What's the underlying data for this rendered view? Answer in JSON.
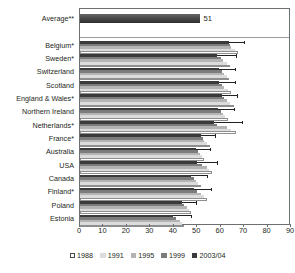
{
  "chart_data": {
    "type": "bar",
    "orientation": "horizontal",
    "title": "",
    "xlabel": "",
    "ylabel": "",
    "xlim": [
      0,
      90
    ],
    "xticks": [
      0,
      10,
      20,
      30,
      40,
      50,
      60,
      70,
      80,
      90
    ],
    "grid": false,
    "legend_position": "bottom",
    "series_names": [
      "1988",
      "1991",
      "1995",
      "1999",
      "2003/04"
    ],
    "series_colors": [
      "#ffffff",
      "#dcdcdc",
      "#b4b4b4",
      "#7c7c7c",
      "#3a3a3a"
    ],
    "average": {
      "label": "Average**",
      "value": 51,
      "value_label": "51",
      "series": "2003/04"
    },
    "categories": [
      "Belgium*",
      "Sweden*",
      "Switzerland",
      "Scotland",
      "England & Wales*",
      "Northern Ireland",
      "Netherlands*",
      "France*",
      "Australia",
      "USA",
      "Canada",
      "Finland*",
      "Poland",
      "Estonia"
    ],
    "series": [
      {
        "name": "1988",
        "values": [
          67.5,
          64.0,
          63.5,
          64.5,
          65.5,
          63.0,
          66.5,
          55.5,
          53.0,
          56.5,
          51.5,
          54.0,
          47.5,
          44.5
        ]
      },
      {
        "name": "1991",
        "values": [
          66.0,
          62.5,
          62.5,
          63.0,
          64.0,
          62.0,
          64.5,
          54.0,
          52.0,
          55.0,
          50.5,
          53.0,
          46.5,
          43.5
        ]
      },
      {
        "name": "1995",
        "values": [
          64.5,
          61.0,
          61.5,
          61.5,
          62.5,
          61.0,
          62.5,
          53.0,
          51.0,
          54.0,
          49.5,
          51.5,
          45.5,
          42.5
        ]
      },
      {
        "name": "1999",
        "values": [
          64.0,
          60.0,
          60.5,
          60.5,
          61.5,
          60.0,
          58.5,
          52.5,
          50.5,
          52.0,
          48.5,
          50.0,
          44.5,
          41.0
        ]
      },
      {
        "name": "2003/04",
        "values": [
          63.5,
          58.5,
          59.5,
          59.5,
          60.5,
          59.0,
          57.0,
          51.5,
          49.5,
          50.0,
          47.5,
          48.5,
          43.5,
          39.5
        ]
      }
    ],
    "error_bars": [
      {
        "category": "Belgium*",
        "upper": 70.0
      },
      {
        "category": "Sweden*",
        "upper": 66.5
      },
      {
        "category": "Switzerland",
        "upper": 66.0
      },
      {
        "category": "Scotland",
        "upper": 66.0
      },
      {
        "category": "England & Wales*",
        "upper": 67.0
      },
      {
        "category": "Northern Ireland",
        "upper": 65.5
      },
      {
        "category": "Netherlands*",
        "upper": 69.0
      },
      {
        "category": "France*",
        "upper": 57.5
      },
      {
        "category": "Australia",
        "upper": 55.5
      },
      {
        "category": "USA",
        "upper": 58.5
      },
      {
        "category": "Canada",
        "upper": 54.0
      },
      {
        "category": "Finland*",
        "upper": 56.0
      },
      {
        "category": "Poland",
        "upper": 49.5
      },
      {
        "category": "Estonia",
        "upper": 47.5
      }
    ]
  },
  "legend": {
    "items": [
      {
        "label": "1988",
        "color": "#ffffff"
      },
      {
        "label": "1991",
        "color": "#dcdcdc"
      },
      {
        "label": "1995",
        "color": "#b4b4b4"
      },
      {
        "label": "1999",
        "color": "#7c7c7c"
      },
      {
        "label": "2003/04",
        "color": "#3a3a3a"
      }
    ]
  }
}
